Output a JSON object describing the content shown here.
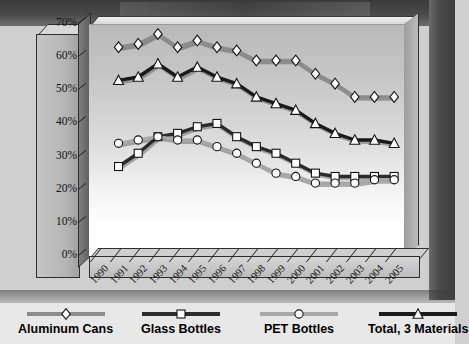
{
  "chart_data": {
    "type": "line",
    "title": "",
    "xlabel": "",
    "ylabel": "",
    "x": [
      "1990",
      "1991",
      "1992",
      "1993",
      "1994",
      "1995",
      "1996",
      "1997",
      "1998",
      "1999",
      "2000",
      "2001",
      "2002",
      "2003",
      "2004",
      "2005"
    ],
    "ylim": [
      0,
      70
    ],
    "ytick_labels": [
      "0%",
      "10%",
      "20%",
      "30%",
      "40%",
      "50%",
      "60%",
      "70%"
    ],
    "ytick_values": [
      0,
      10,
      20,
      30,
      40,
      50,
      60,
      70
    ],
    "grid": false,
    "legend_position": "bottom",
    "series": [
      {
        "name": "Aluminum Cans",
        "marker": "diamond",
        "color": "#8c8c8c",
        "values": [
          null,
          63,
          64,
          67,
          63,
          65,
          63,
          62,
          59,
          59,
          59,
          55,
          52,
          48,
          48,
          48
        ]
      },
      {
        "name": "Glass Bottles",
        "marker": "square",
        "color": "#2b2b2b",
        "values": [
          null,
          27,
          31,
          36,
          37,
          39,
          40,
          36,
          33,
          31,
          28,
          25,
          24,
          24,
          24,
          24
        ]
      },
      {
        "name": "PET Bottles",
        "marker": "circle",
        "color": "#a8a8a8",
        "values": [
          null,
          34,
          35,
          36,
          35,
          35,
          33,
          31,
          28,
          25,
          24,
          22,
          22,
          22,
          23,
          23
        ]
      },
      {
        "name": "Total, 3 Materials",
        "marker": "triangle",
        "color": "#1a1a1a",
        "values": [
          null,
          53,
          54,
          58,
          54,
          57,
          54,
          52,
          48,
          46,
          44,
          40,
          37,
          35,
          35,
          34
        ]
      }
    ]
  },
  "legend": {
    "items": [
      {
        "label": "Aluminum Cans",
        "marker": "diamond-marker",
        "color": "#8c8c8c"
      },
      {
        "label": "Glass Bottles",
        "marker": "square-marker",
        "color": "#2b2b2b"
      },
      {
        "label": "PET Bottles",
        "marker": "circle-marker",
        "color": "#a8a8a8"
      },
      {
        "label": "Total, 3 Materials",
        "marker": "triangle-marker",
        "color": "#1a1a1a"
      }
    ]
  }
}
